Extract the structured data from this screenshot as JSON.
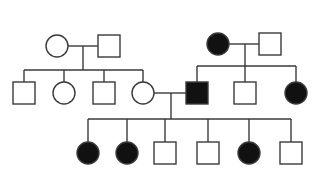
{
  "diagram": {
    "type": "pedigree",
    "colors": {
      "affected": "#111111",
      "unaffected": "#ffffff",
      "stroke": "#3a3a3a"
    },
    "individuals": [
      {
        "id": "I-1",
        "sex": "female",
        "affected": false,
        "cx": 57,
        "cy": 46
      },
      {
        "id": "I-2",
        "sex": "male",
        "affected": false,
        "cx": 109,
        "cy": 46
      },
      {
        "id": "I-3",
        "sex": "female",
        "affected": true,
        "cx": 218,
        "cy": 44
      },
      {
        "id": "I-4",
        "sex": "male",
        "affected": false,
        "cx": 270,
        "cy": 44
      },
      {
        "id": "II-1",
        "sex": "male",
        "affected": false,
        "cx": 24,
        "cy": 93
      },
      {
        "id": "II-2",
        "sex": "female",
        "affected": false,
        "cx": 64,
        "cy": 93
      },
      {
        "id": "II-3",
        "sex": "male",
        "affected": false,
        "cx": 104,
        "cy": 93
      },
      {
        "id": "II-4",
        "sex": "female",
        "affected": false,
        "cx": 143,
        "cy": 93
      },
      {
        "id": "II-5",
        "sex": "male",
        "affected": true,
        "cx": 197,
        "cy": 93
      },
      {
        "id": "II-6",
        "sex": "male",
        "affected": false,
        "cx": 245,
        "cy": 93
      },
      {
        "id": "II-7",
        "sex": "female",
        "affected": true,
        "cx": 296,
        "cy": 93
      },
      {
        "id": "III-1",
        "sex": "female",
        "affected": true,
        "cx": 88,
        "cy": 153
      },
      {
        "id": "III-2",
        "sex": "female",
        "affected": true,
        "cx": 127,
        "cy": 153
      },
      {
        "id": "III-3",
        "sex": "male",
        "affected": false,
        "cx": 165,
        "cy": 153
      },
      {
        "id": "III-4",
        "sex": "male",
        "affected": false,
        "cx": 208,
        "cy": 153
      },
      {
        "id": "III-5",
        "sex": "female",
        "affected": true,
        "cx": 249,
        "cy": 153
      },
      {
        "id": "III-6",
        "sex": "male",
        "affected": false,
        "cx": 291,
        "cy": 153
      }
    ],
    "families": [
      {
        "parents": [
          "I-1",
          "I-2"
        ],
        "marriage_y": 46,
        "drop_x": 83,
        "sibship_y": 70,
        "children": [
          "II-1",
          "II-2",
          "II-3",
          "II-4"
        ]
      },
      {
        "parents": [
          "I-3",
          "I-4"
        ],
        "marriage_y": 44,
        "drop_x": 245,
        "sibship_y": 66,
        "children": [
          "II-5",
          "II-6",
          "II-7"
        ]
      },
      {
        "parents": [
          "II-4",
          "II-5"
        ],
        "marriage_y": 93,
        "drop_x": 171,
        "sibship_y": 119,
        "children": [
          "III-1",
          "III-2",
          "III-3",
          "III-4",
          "III-5",
          "III-6"
        ]
      }
    ],
    "symbol_size": 22
  }
}
